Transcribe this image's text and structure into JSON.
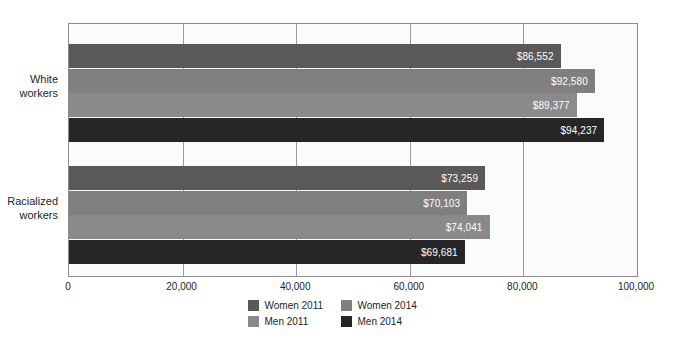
{
  "chart_data": {
    "type": "bar",
    "orientation": "horizontal",
    "title": "",
    "subtitle": "",
    "xlabel": "",
    "ylabel": "",
    "xlim": [
      0,
      100000
    ],
    "ylim": null,
    "grid": true,
    "legend_position": "bottom",
    "categories": [
      "White workers",
      "Racialized workers"
    ],
    "category_lines": [
      [
        "White",
        "workers"
      ],
      [
        "Racialized",
        "workers"
      ]
    ],
    "xticks": [
      0,
      20000,
      40000,
      60000,
      80000,
      100000
    ],
    "xtick_labels": [
      "0",
      "20,000",
      "40,000",
      "60,000",
      "80,000",
      "100,000"
    ],
    "series": [
      {
        "name": "Women 2011",
        "color": "#595959",
        "values": [
          86552,
          73259
        ],
        "labels": [
          "$86,552",
          "$73,259"
        ]
      },
      {
        "name": "Women 2014",
        "color": "#7f7f7f",
        "values": [
          92580,
          70103
        ],
        "labels": [
          "$92,580",
          "$70,103"
        ]
      },
      {
        "name": "Men 2011",
        "color": "#8a8a8a",
        "values": [
          89377,
          74041
        ],
        "labels": [
          "$89,377",
          "$74,041"
        ]
      },
      {
        "name": "Men 2014",
        "color": "#262626",
        "values": [
          94237,
          69681
        ],
        "labels": [
          "$94,237",
          "$69,681"
        ]
      }
    ],
    "legend": [
      {
        "label": "Women 2011",
        "color": "#595959"
      },
      {
        "label": "Women 2014",
        "color": "#7f7f7f"
      },
      {
        "label": "Men 2011",
        "color": "#8a8a8a"
      },
      {
        "label": "Men 2014",
        "color": "#262626"
      }
    ],
    "colors": {
      "plot_background": "#fbfbfb",
      "page_background": "#ffffff",
      "axis": "#8d8d8d",
      "gridline": "#9a9a9a",
      "text": "#231f20",
      "bar_label_text": "#ffffff"
    }
  }
}
